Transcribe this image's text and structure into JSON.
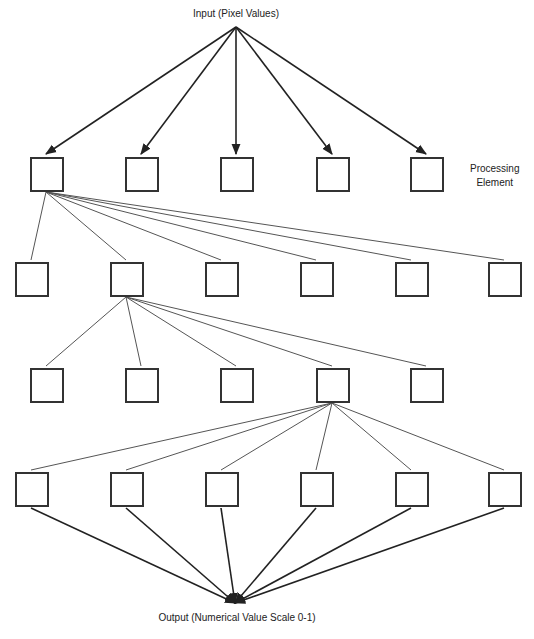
{
  "diagram": {
    "title": "",
    "input_label": "Input (Pixel Values)",
    "output_label": "Output (Numerical Value Scale 0-1)",
    "annotation": {
      "line1": "Processing",
      "line2": "Element"
    },
    "colors": {
      "stroke": "#333333",
      "line": "#444444",
      "background": "#ffffff"
    },
    "source_point": {
      "x": 236,
      "y": 27
    },
    "sink_point": {
      "x": 235,
      "y": 603
    },
    "box_size": {
      "w": 32,
      "h": 33
    },
    "layers": [
      {
        "name": "layer-1",
        "y": 157,
        "xs": [
          30,
          125,
          220,
          316,
          410
        ],
        "fan_from": null
      },
      {
        "name": "layer-2",
        "y": 262,
        "xs": [
          15,
          110,
          205,
          300,
          395,
          488
        ],
        "fan_from": 0
      },
      {
        "name": "layer-3",
        "y": 368,
        "xs": [
          30,
          125,
          220,
          316,
          410
        ],
        "fan_from": 1
      },
      {
        "name": "layer-4",
        "y": 472,
        "xs": [
          15,
          110,
          205,
          300,
          395,
          488
        ],
        "fan_from": 3
      }
    ],
    "edges": [
      {
        "from": "input",
        "to": "layer-1",
        "style": "arrow"
      },
      {
        "from": "layer-1[0]",
        "to": "layer-2[all]",
        "style": "thin-line"
      },
      {
        "from": "layer-2[1]",
        "to": "layer-3[all]",
        "style": "thin-line"
      },
      {
        "from": "layer-3[3]",
        "to": "layer-4[all]",
        "style": "thin-line"
      },
      {
        "from": "layer-4[all]",
        "to": "output",
        "style": "arrow"
      }
    ]
  }
}
